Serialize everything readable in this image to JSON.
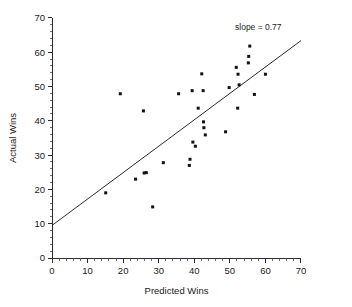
{
  "chart_data": {
    "type": "scatter",
    "title": "",
    "xlabel": "Predicted Wins",
    "ylabel": "Actual Wins",
    "xlim": [
      0,
      70
    ],
    "ylim": [
      0,
      70
    ],
    "xticks": [
      0,
      10,
      20,
      30,
      40,
      50,
      60,
      70
    ],
    "yticks": [
      0,
      10,
      20,
      30,
      40,
      50,
      60,
      70
    ],
    "xtick_labels": [
      "0",
      "10",
      "20",
      "30",
      "40",
      "50",
      "60",
      "70"
    ],
    "ytick_labels": [
      "0",
      "10",
      "20",
      "30",
      "40",
      "50",
      "60",
      "70"
    ],
    "minor_tick_interval": 2,
    "grid": false,
    "legend_position": "none",
    "annotations": [
      {
        "name": "slope-annotation",
        "text": "slope = 0.77",
        "x": 58,
        "y": 66.5
      }
    ],
    "fit_line": {
      "name": "regression-line",
      "label": "slope = 0.77",
      "slope": 0.77,
      "intercept": 9.5,
      "x_start": 0,
      "x_end": 70,
      "y_start": 9.5,
      "y_end": 63.4
    },
    "series": [
      {
        "name": "Teams",
        "marker": "square",
        "color": "#111111",
        "points": [
          {
            "x": 15.1,
            "y": 19.0
          },
          {
            "x": 19.2,
            "y": 47.9
          },
          {
            "x": 23.5,
            "y": 23.0
          },
          {
            "x": 25.7,
            "y": 42.9
          },
          {
            "x": 25.9,
            "y": 24.8
          },
          {
            "x": 26.5,
            "y": 24.9
          },
          {
            "x": 28.3,
            "y": 14.9
          },
          {
            "x": 31.3,
            "y": 27.8
          },
          {
            "x": 35.6,
            "y": 47.9
          },
          {
            "x": 38.6,
            "y": 27.0
          },
          {
            "x": 38.8,
            "y": 28.8
          },
          {
            "x": 39.4,
            "y": 48.8
          },
          {
            "x": 39.6,
            "y": 33.8
          },
          {
            "x": 40.3,
            "y": 32.6
          },
          {
            "x": 41.1,
            "y": 43.7
          },
          {
            "x": 42.1,
            "y": 53.7
          },
          {
            "x": 42.5,
            "y": 48.8
          },
          {
            "x": 42.6,
            "y": 39.7
          },
          {
            "x": 42.7,
            "y": 38.0
          },
          {
            "x": 43.1,
            "y": 35.9
          },
          {
            "x": 48.8,
            "y": 36.8
          },
          {
            "x": 49.8,
            "y": 49.7
          },
          {
            "x": 51.8,
            "y": 55.6
          },
          {
            "x": 52.2,
            "y": 43.7
          },
          {
            "x": 52.3,
            "y": 53.6
          },
          {
            "x": 52.6,
            "y": 50.5
          },
          {
            "x": 55.2,
            "y": 56.9
          },
          {
            "x": 55.3,
            "y": 58.8
          },
          {
            "x": 55.6,
            "y": 61.8
          },
          {
            "x": 56.9,
            "y": 47.7
          },
          {
            "x": 60.0,
            "y": 53.6
          }
        ]
      }
    ]
  },
  "geometry": {
    "plot_left_px": 52,
    "plot_bottom_px": 258,
    "px_per_x_unit": 3.557,
    "px_per_y_unit": 3.429,
    "point_size_px": 3.0
  }
}
